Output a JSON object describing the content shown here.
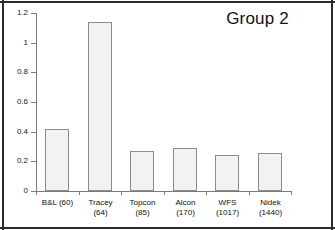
{
  "chart_data": {
    "type": "bar",
    "title": "Group 2",
    "xlabel": "",
    "ylabel": "",
    "ylim": [
      0,
      1.2
    ],
    "ytick_labels": [
      "0",
      "0.2",
      "0.4",
      "0.6",
      "0.8",
      "1",
      "1.2"
    ],
    "ytick_values": [
      0,
      0.2,
      0.4,
      0.6,
      0.8,
      1,
      1.2
    ],
    "grid": false,
    "legend": false,
    "categories": [
      "B&L (60)",
      "Tracey (64)",
      "Topcon (85)",
      "Alcon (170)",
      "WFS (1017)",
      "Nidek (1440)"
    ],
    "category_lines": [
      [
        "B&L (60)",
        ""
      ],
      [
        "Tracey",
        "(64)"
      ],
      [
        "Topcon",
        "(85)"
      ],
      [
        "Alcon",
        "(170)"
      ],
      [
        "WFS",
        "(1017)"
      ],
      [
        "Nidek",
        "(1440)"
      ]
    ],
    "values": [
      0.42,
      1.14,
      0.27,
      0.29,
      0.24,
      0.255
    ],
    "colors": {
      "bar_fill": "#f2f2f2",
      "bar_stroke": "#8c8c8c",
      "axis": "#7a7a7a",
      "text": "#111111",
      "frame": "#2b2b2b",
      "plot_background": "#ffffff"
    }
  }
}
